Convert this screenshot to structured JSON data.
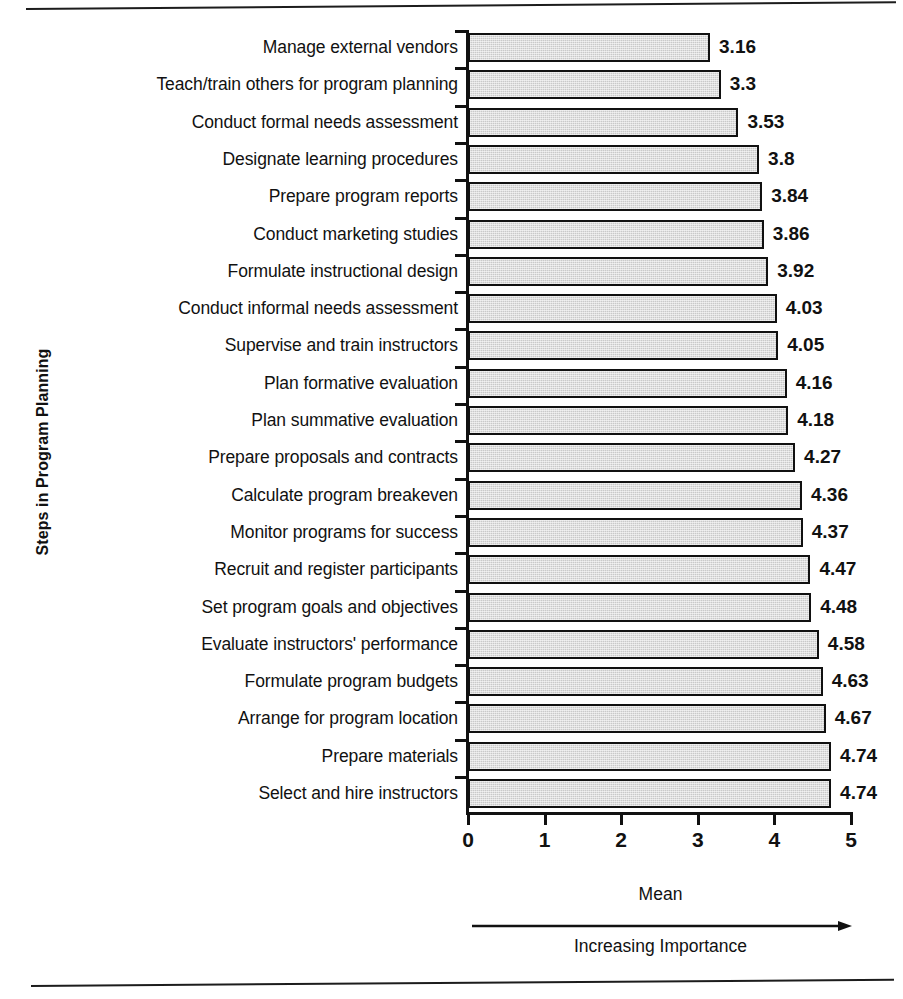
{
  "chart_data": {
    "type": "bar",
    "orientation": "horizontal",
    "title": "",
    "xlabel": "Mean",
    "ylabel": "Steps in Program Planning",
    "xlim": [
      0,
      5
    ],
    "x_ticks": [
      "0",
      "1",
      "2",
      "3",
      "4",
      "5"
    ],
    "grid": false,
    "legend": null,
    "annotation_below_axis": "Increasing Importance",
    "bar_fill_color": "#c9c9c9",
    "bar_border_color": "#111111",
    "categories": [
      "Manage external vendors",
      "Teach/train others for program planning",
      "Conduct formal needs assessment",
      "Designate learning procedures",
      "Prepare program reports",
      "Conduct marketing studies",
      "Formulate instructional design",
      "Conduct informal needs assessment",
      "Supervise and train instructors",
      "Plan formative evaluation",
      "Plan summative evaluation",
      "Prepare proposals and contracts",
      "Calculate program breakeven",
      "Monitor programs for success",
      "Recruit and register participants",
      "Set program goals and objectives",
      "Evaluate instructors' performance",
      "Formulate program budgets",
      "Arrange for program location",
      "Prepare materials",
      "Select and hire instructors"
    ],
    "values": [
      3.16,
      3.3,
      3.53,
      3.8,
      3.84,
      3.86,
      3.92,
      4.03,
      4.05,
      4.16,
      4.18,
      4.27,
      4.36,
      4.37,
      4.47,
      4.48,
      4.58,
      4.63,
      4.67,
      4.74,
      4.74
    ],
    "value_labels": [
      "3.16",
      "3.3",
      "3.53",
      "3.8",
      "3.84",
      "3.86",
      "3.92",
      "4.03",
      "4.05",
      "4.16",
      "4.18",
      "4.27",
      "4.36",
      "4.37",
      "4.47",
      "4.48",
      "4.58",
      "4.63",
      "4.67",
      "4.74",
      "4.74"
    ]
  }
}
